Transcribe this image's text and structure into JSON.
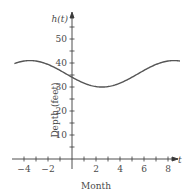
{
  "chart_data": {
    "type": "line",
    "title": "",
    "xlabel": "Month",
    "ylabel": "Depth (feet)",
    "y_axis_name": "h(t)",
    "x_axis_name": "t",
    "xlim": [
      -4.5,
      9
    ],
    "ylim": [
      0,
      58
    ],
    "x_ticks": [
      -4,
      -3,
      -2,
      -1,
      1,
      2,
      3,
      4,
      5,
      6,
      7,
      8
    ],
    "x_tick_labels": [
      "-4",
      "-2",
      "2",
      "4",
      "6",
      "8"
    ],
    "x_tick_label_values": [
      -4,
      -2,
      2,
      4,
      6,
      8
    ],
    "y_ticks": [
      5,
      10,
      15,
      20,
      25,
      30,
      35,
      40,
      45,
      50,
      55
    ],
    "y_tick_labels": [
      "10",
      "20",
      "30",
      "40",
      "50"
    ],
    "y_tick_label_values": [
      10,
      20,
      30,
      40,
      50
    ],
    "grid": false,
    "series": [
      {
        "name": "h(t)",
        "x": [
          -6,
          -5,
          -4,
          -3.5,
          -3,
          -2,
          -1,
          0,
          1,
          2,
          2.5,
          3,
          4,
          5,
          6,
          7,
          8,
          8.5,
          9,
          10
        ],
        "values": [
          38.3,
          40.3,
          41.0,
          41.0,
          40.8,
          39.4,
          37.0,
          34.1,
          31.8,
          30.3,
          30.0,
          30.2,
          31.5,
          33.6,
          36.5,
          39.2,
          40.8,
          41.0,
          40.9,
          39.7
        ]
      }
    ],
    "annotations": []
  }
}
